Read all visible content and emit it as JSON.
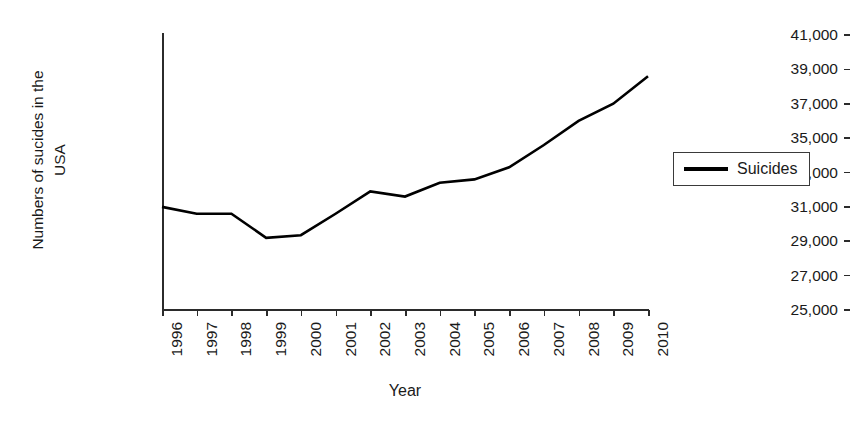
{
  "chart_data": {
    "type": "line",
    "title": "",
    "xlabel": "Year",
    "ylabel": "Numbers of sucides in the USA",
    "ylabel_line1": "Numbers of sucides in the",
    "ylabel_line2": "USA",
    "categories": [
      "1996",
      "1997",
      "1998",
      "1999",
      "2000",
      "2001",
      "2002",
      "2003",
      "2004",
      "2005",
      "2006",
      "2007",
      "2008",
      "2009",
      "2010"
    ],
    "series": [
      {
        "name": "Suicides",
        "color": "#000000",
        "values": [
          31000,
          30600,
          30600,
          29200,
          29350,
          30600,
          31900,
          31600,
          32400,
          32600,
          33300,
          34600,
          36000,
          37000,
          38600
        ]
      }
    ],
    "ylim": [
      25000,
      41000
    ],
    "ytick_values": [
      41000,
      39000,
      37000,
      35000,
      33000,
      31000,
      29000,
      27000,
      25000
    ],
    "ytick_labels": [
      "41,000",
      "39,000",
      "37,000",
      "35,000",
      "33,000",
      "31,000",
      "29,000",
      "27,000",
      "25,000"
    ],
    "grid": false,
    "legend_position": "right",
    "legend_entries": [
      "Suicides"
    ]
  }
}
